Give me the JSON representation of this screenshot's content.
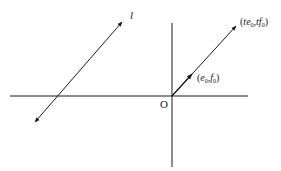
{
  "diagram": {
    "origin_label": "O",
    "line_label": "l",
    "point_near": {
      "open": "(",
      "e": "e",
      "sub_e": "0",
      "comma": ",",
      "f": "f",
      "sub_f": "0",
      "close": ")"
    },
    "point_far": {
      "open": "(",
      "t1": "t",
      "e": "e",
      "sub_e": "0",
      "comma": ",",
      "t2": "t",
      "f": "f",
      "sub_f": "0",
      "close": ")"
    },
    "colors": {
      "line": "#1a1a1a",
      "background": "#ffffff"
    }
  }
}
